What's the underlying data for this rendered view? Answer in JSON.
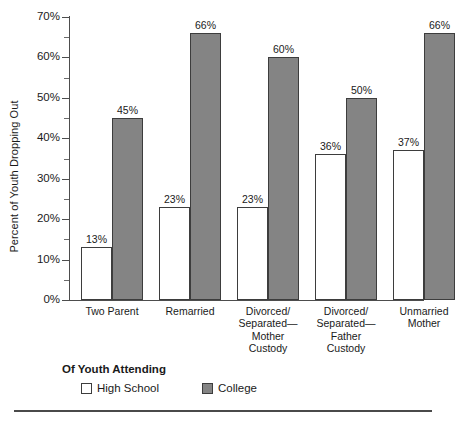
{
  "chart_data": {
    "type": "bar",
    "title": "",
    "xlabel": "",
    "ylabel": "Percent of Youth Dropping Out",
    "ylim": [
      0,
      70
    ],
    "ytick_labels": [
      "0%",
      "10%",
      "20%",
      "30%",
      "40%",
      "50%",
      "60%",
      "70%"
    ],
    "ytick_values": [
      0,
      10,
      20,
      30,
      40,
      50,
      60,
      70
    ],
    "minor_tick_values": [
      5,
      15,
      25,
      35,
      45,
      55,
      65
    ],
    "grid": false,
    "legend_position": "below-plot-left",
    "legend_title": "Of  Youth Attending",
    "categories": [
      "Two Parent",
      "Remarried",
      "Divorced/ Separated— Mother Custody",
      "Divorced/ Separated— Father Custody",
      "Unmarried Mother"
    ],
    "category_lines": [
      [
        "Two Parent"
      ],
      [
        "Remarried"
      ],
      [
        "Divorced/",
        "Separated—",
        "Mother",
        "Custody"
      ],
      [
        "Divorced/",
        "Separated—",
        "Father",
        "Custody"
      ],
      [
        "Unmarried",
        "Mother"
      ]
    ],
    "series": [
      {
        "name": "High School",
        "color": "#ffffff",
        "values": [
          13,
          23,
          23,
          36,
          37
        ],
        "labels": [
          "13%",
          "23%",
          "23%",
          "36%",
          "37%"
        ]
      },
      {
        "name": "College",
        "color": "#848484",
        "values": [
          45,
          66,
          60,
          50,
          66
        ],
        "labels": [
          "45%",
          "66%",
          "60%",
          "50%",
          "66%"
        ]
      }
    ]
  },
  "colors": {
    "high_school_fill": "#ffffff",
    "college_fill": "#848484",
    "bar_border": "#3d3d3d",
    "axis": "#4d4d4d",
    "text": "#1a1a1a"
  }
}
